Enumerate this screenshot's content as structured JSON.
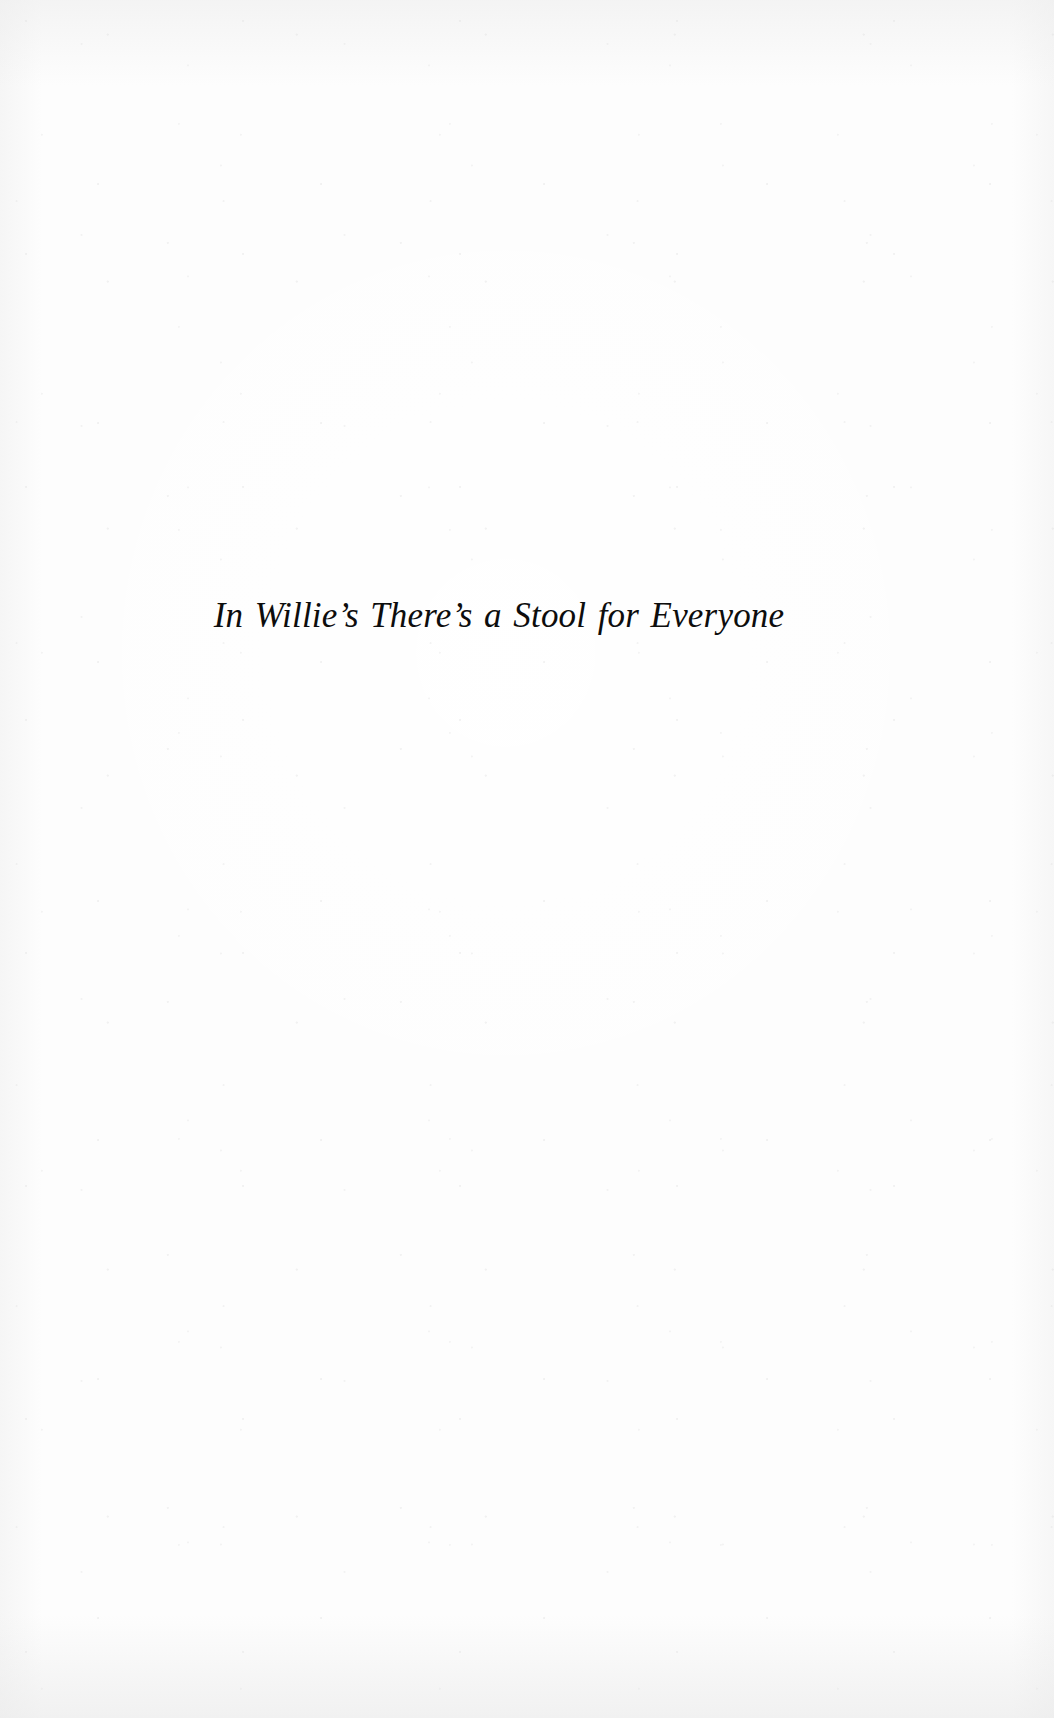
{
  "page": {
    "kind": "scanned-book-part-title-page",
    "background_color": "#fdfdfd",
    "text_color": "#0d0d0d",
    "width": 1054,
    "height": 1718
  },
  "title": {
    "text": "In Willie’s There’s a Stool for Everyone"
  }
}
